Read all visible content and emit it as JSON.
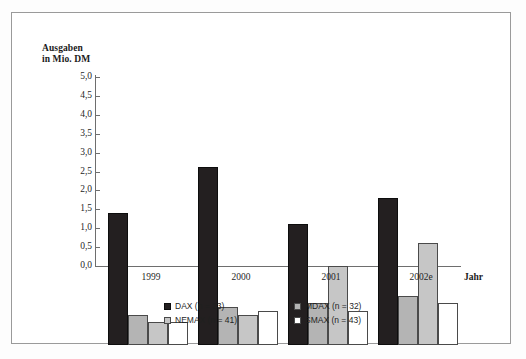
{
  "page": {
    "top_cut_text": ""
  },
  "chart_data": {
    "type": "bar",
    "title": "",
    "ylabel": "Ausgaben\nin Mio. DM",
    "xlabel": "Jahr",
    "ylim": [
      0.0,
      5.0
    ],
    "ytick_labels": [
      "5,0",
      "4,5",
      "4,0",
      "3,5",
      "3,0",
      "2,5",
      "2,0",
      "1,5",
      "1,0",
      "0,5",
      "0,0"
    ],
    "ytick_values": [
      5.0,
      4.5,
      4.0,
      3.5,
      3.0,
      2.5,
      2.0,
      1.5,
      1.0,
      0.5,
      0.0
    ],
    "grid": false,
    "legend_position": "bottom",
    "categories": [
      "1999",
      "2000",
      "2001",
      "2002e"
    ],
    "series": [
      {
        "name": "DAX (n = 23)",
        "key": "dax",
        "color": "#231f20",
        "values": [
          3.5,
          4.7,
          3.2,
          3.9
        ]
      },
      {
        "name": "MDAX (n = 32)",
        "key": "mdax",
        "color": "#b4b4b4",
        "values": [
          0.8,
          1.0,
          1.1,
          1.3
        ]
      },
      {
        "name": "NEMAX (n = 41)",
        "key": "nemax",
        "color": "#c6c6c6",
        "values": [
          0.6,
          0.8,
          2.1,
          2.7
        ]
      },
      {
        "name": "SMAX (n = 43)",
        "key": "smax",
        "color": "#ffffff",
        "values": [
          0.6,
          0.9,
          0.9,
          1.1
        ]
      }
    ]
  }
}
